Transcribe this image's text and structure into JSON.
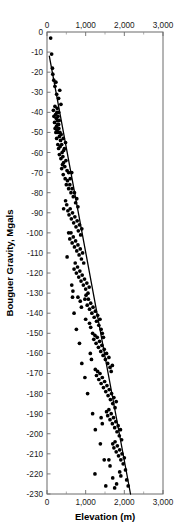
{
  "chart_data": {
    "type": "scatter",
    "title": "",
    "xlabel": "Elevation (m)",
    "ylabel": "Bouguer Gravity, Mgals",
    "xlim": [
      0,
      3000
    ],
    "ylim": [
      -230,
      0
    ],
    "grid": false,
    "legend": null,
    "x_axis": {
      "label": "Elevation (m)",
      "tick_labels": [
        "0",
        "1,000",
        "2,000",
        "3,000"
      ],
      "tick_values": [
        0,
        1000,
        2000,
        3000
      ],
      "minor_tick_values": [
        500,
        1500,
        2500
      ],
      "mirrored_top_axis": true
    },
    "y_axis": {
      "label": "Bouguer Gravity, Mgals",
      "tick_labels": [
        "0",
        "-10",
        "-20",
        "-30",
        "-40",
        "-50",
        "-60",
        "-70",
        "-80",
        "-90",
        "-100",
        "-110",
        "-120",
        "-130",
        "-140",
        "-150",
        "-160",
        "-170",
        "-180",
        "-190",
        "-200",
        "-210",
        "-220",
        "-230"
      ],
      "tick_values": [
        0,
        -10,
        -20,
        -30,
        -40,
        -50,
        -60,
        -70,
        -80,
        -90,
        -100,
        -110,
        -120,
        -130,
        -140,
        -150,
        -160,
        -170,
        -180,
        -190,
        -200,
        -210,
        -220,
        -230
      ]
    },
    "marker": {
      "shape": "circle",
      "color": "#000000",
      "size_px": 2.6
    },
    "fit_line": {
      "type": "linear-regression",
      "color": "#000000",
      "x": [
        60,
        2160
      ],
      "y": [
        -12,
        -230
      ]
    },
    "points": [
      [
        95,
        -3
      ],
      [
        120,
        -11
      ],
      [
        140,
        -18
      ],
      [
        150,
        -21
      ],
      [
        175,
        -24
      ],
      [
        205,
        -27
      ],
      [
        230,
        -25
      ],
      [
        250,
        -31
      ],
      [
        300,
        -33
      ],
      [
        330,
        -29
      ],
      [
        360,
        -36
      ],
      [
        265,
        -38
      ],
      [
        300,
        -40
      ],
      [
        205,
        -37
      ],
      [
        225,
        -41
      ],
      [
        240,
        -43
      ],
      [
        255,
        -40
      ],
      [
        270,
        -44
      ],
      [
        285,
        -42
      ],
      [
        300,
        -46
      ],
      [
        315,
        -44
      ],
      [
        245,
        -47
      ],
      [
        260,
        -49
      ],
      [
        275,
        -46
      ],
      [
        290,
        -50
      ],
      [
        305,
        -48
      ],
      [
        320,
        -52
      ],
      [
        335,
        -50
      ],
      [
        350,
        -54
      ],
      [
        365,
        -51
      ],
      [
        380,
        -56
      ],
      [
        420,
        -53
      ],
      [
        450,
        -58
      ],
      [
        480,
        -55
      ],
      [
        390,
        -60
      ],
      [
        410,
        -62
      ],
      [
        430,
        -59
      ],
      [
        280,
        -56
      ],
      [
        300,
        -58
      ],
      [
        320,
        -61
      ],
      [
        340,
        -57
      ],
      [
        360,
        -63
      ],
      [
        250,
        -53
      ],
      [
        230,
        -50
      ],
      [
        210,
        -48
      ],
      [
        195,
        -45
      ],
      [
        180,
        -42
      ],
      [
        165,
        -39
      ],
      [
        430,
        -65
      ],
      [
        460,
        -67
      ],
      [
        490,
        -64
      ],
      [
        520,
        -69
      ],
      [
        400,
        -66
      ],
      [
        380,
        -68
      ],
      [
        420,
        -71
      ],
      [
        560,
        -70
      ],
      [
        600,
        -73
      ],
      [
        640,
        -70
      ],
      [
        470,
        -73
      ],
      [
        500,
        -76
      ],
      [
        530,
        -74
      ],
      [
        560,
        -78
      ],
      [
        590,
        -76
      ],
      [
        620,
        -80
      ],
      [
        650,
        -78
      ],
      [
        680,
        -82
      ],
      [
        710,
        -80
      ],
      [
        740,
        -85
      ],
      [
        770,
        -83
      ],
      [
        800,
        -87
      ],
      [
        480,
        -84
      ],
      [
        510,
        -86
      ],
      [
        430,
        -88
      ],
      [
        540,
        -89
      ],
      [
        570,
        -91
      ],
      [
        600,
        -88
      ],
      [
        630,
        -93
      ],
      [
        660,
        -90
      ],
      [
        690,
        -95
      ],
      [
        720,
        -92
      ],
      [
        750,
        -97
      ],
      [
        780,
        -94
      ],
      [
        810,
        -99
      ],
      [
        840,
        -96
      ],
      [
        870,
        -101
      ],
      [
        900,
        -98
      ],
      [
        560,
        -100
      ],
      [
        590,
        -103
      ],
      [
        620,
        -100
      ],
      [
        650,
        -105
      ],
      [
        680,
        -102
      ],
      [
        710,
        -107
      ],
      [
        740,
        -104
      ],
      [
        770,
        -109
      ],
      [
        800,
        -106
      ],
      [
        830,
        -111
      ],
      [
        860,
        -108
      ],
      [
        890,
        -113
      ],
      [
        920,
        -110
      ],
      [
        950,
        -115
      ],
      [
        520,
        -112
      ],
      [
        700,
        -118
      ],
      [
        730,
        -115
      ],
      [
        760,
        -120
      ],
      [
        790,
        -117
      ],
      [
        820,
        -122
      ],
      [
        850,
        -119
      ],
      [
        880,
        -124
      ],
      [
        910,
        -121
      ],
      [
        940,
        -126
      ],
      [
        970,
        -123
      ],
      [
        1000,
        -128
      ],
      [
        1030,
        -125
      ],
      [
        1060,
        -130
      ],
      [
        1090,
        -127
      ],
      [
        640,
        -126
      ],
      [
        670,
        -129
      ],
      [
        980,
        -133
      ],
      [
        1010,
        -131
      ],
      [
        1040,
        -136
      ],
      [
        1070,
        -133
      ],
      [
        1100,
        -138
      ],
      [
        1130,
        -135
      ],
      [
        1160,
        -140
      ],
      [
        1190,
        -137
      ],
      [
        860,
        -134
      ],
      [
        890,
        -137
      ],
      [
        800,
        -132
      ],
      [
        1220,
        -142
      ],
      [
        1250,
        -139
      ],
      [
        1280,
        -144
      ],
      [
        1310,
        -141
      ],
      [
        1340,
        -146
      ],
      [
        1370,
        -143
      ],
      [
        1400,
        -148
      ],
      [
        1100,
        -145
      ],
      [
        1130,
        -147
      ],
      [
        1000,
        -143
      ],
      [
        1430,
        -150
      ],
      [
        1460,
        -152
      ],
      [
        1180,
        -150
      ],
      [
        1210,
        -153
      ],
      [
        1240,
        -151
      ],
      [
        1270,
        -155
      ],
      [
        1300,
        -152
      ],
      [
        1330,
        -157
      ],
      [
        1360,
        -154
      ],
      [
        1390,
        -159
      ],
      [
        1420,
        -156
      ],
      [
        1450,
        -161
      ],
      [
        1480,
        -158
      ],
      [
        1510,
        -163
      ],
      [
        1540,
        -160
      ],
      [
        1570,
        -165
      ],
      [
        1600,
        -162
      ],
      [
        1120,
        -160
      ],
      [
        1150,
        -163
      ],
      [
        1630,
        -167
      ],
      [
        1660,
        -169
      ],
      [
        1690,
        -166
      ],
      [
        1250,
        -168
      ],
      [
        1280,
        -171
      ],
      [
        1310,
        -169
      ],
      [
        1340,
        -173
      ],
      [
        1370,
        -170
      ],
      [
        1400,
        -175
      ],
      [
        1430,
        -172
      ],
      [
        1460,
        -177
      ],
      [
        1490,
        -174
      ],
      [
        1520,
        -179
      ],
      [
        1550,
        -176
      ],
      [
        1580,
        -181
      ],
      [
        1610,
        -178
      ],
      [
        1640,
        -183
      ],
      [
        1670,
        -180
      ],
      [
        1700,
        -185
      ],
      [
        1730,
        -182
      ],
      [
        1760,
        -187
      ],
      [
        1790,
        -184
      ],
      [
        1540,
        -189
      ],
      [
        1570,
        -191
      ],
      [
        1600,
        -188
      ],
      [
        1630,
        -193
      ],
      [
        1660,
        -190
      ],
      [
        1690,
        -195
      ],
      [
        1720,
        -192
      ],
      [
        1750,
        -197
      ],
      [
        1780,
        -194
      ],
      [
        1810,
        -199
      ],
      [
        1840,
        -196
      ],
      [
        1400,
        -192
      ],
      [
        1430,
        -195
      ],
      [
        1870,
        -201
      ],
      [
        1900,
        -198
      ],
      [
        1930,
        -203
      ],
      [
        1700,
        -205
      ],
      [
        1730,
        -207
      ],
      [
        1760,
        -204
      ],
      [
        1790,
        -209
      ],
      [
        1820,
        -206
      ],
      [
        1850,
        -211
      ],
      [
        1880,
        -208
      ],
      [
        1910,
        -213
      ],
      [
        1940,
        -210
      ],
      [
        1970,
        -215
      ],
      [
        2000,
        -212
      ],
      [
        1600,
        -213
      ],
      [
        1630,
        -216
      ],
      [
        1880,
        -219
      ],
      [
        1910,
        -221
      ],
      [
        1700,
        -222
      ],
      [
        2030,
        -218
      ],
      [
        2060,
        -223
      ],
      [
        1750,
        -227
      ],
      [
        1800,
        -225
      ],
      [
        1380,
        -205
      ],
      [
        1250,
        -198
      ],
      [
        1180,
        -190
      ],
      [
        1050,
        -180
      ],
      [
        980,
        -172
      ],
      [
        900,
        -165
      ],
      [
        840,
        -155
      ],
      [
        760,
        -148
      ],
      [
        700,
        -140
      ],
      [
        660,
        -132
      ],
      [
        1240,
        -220
      ],
      [
        1480,
        -213
      ],
      [
        1520,
        -226
      ],
      [
        2100,
        -226
      ]
    ]
  }
}
